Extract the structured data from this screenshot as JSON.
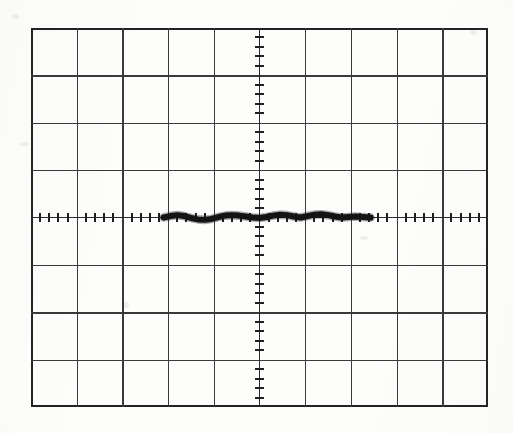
{
  "image": {
    "kind": "oscilloscope-screen-photograph",
    "background_color": "#fdfdfc",
    "width": 513,
    "height": 433
  },
  "graticule": {
    "name": "oscilloscope-graticule",
    "left": 31,
    "top": 28,
    "width": 457,
    "height": 379,
    "horizontal_divisions": 10,
    "vertical_divisions": 8,
    "division_width_px": 45.7,
    "division_height_px": 47.375,
    "border_color": "#232323",
    "border_width_px": 2.2,
    "grid_color": "#3a3a3a",
    "grid_line_width_px": 1.25,
    "center_x_px": 254,
    "center_y_px": 217,
    "subdivisions_per_division": 5,
    "tick_color": "#1f1f1f",
    "tick_length_px": 9
  },
  "chart_data": {
    "type": "line",
    "title": "",
    "subtitle": "",
    "xlabel": "",
    "ylabel": "",
    "legend": [],
    "grid": true,
    "legend_position": "none",
    "x_unit": "division",
    "y_unit": "division",
    "xlim": [
      -5,
      5
    ],
    "ylim": [
      -4,
      4
    ],
    "xticks": [
      -5,
      -4,
      -3,
      -2,
      -1,
      0,
      1,
      2,
      3,
      4,
      5
    ],
    "yticks": [
      -4,
      -3,
      -2,
      -1,
      0,
      1,
      2,
      3,
      4
    ],
    "xtick_labels": [
      "",
      "",
      "",
      "",
      "",
      "",
      "",
      "",
      "",
      "",
      ""
    ],
    "ytick_labels": [
      "",
      "",
      "",
      "",
      "",
      "",
      "",
      "",
      ""
    ],
    "series": [
      {
        "name": "trace",
        "color": "#141414",
        "stroke_width_px": 6,
        "x_start_div": -2.1,
        "x_end_div": 2.43,
        "x": [
          -2.1,
          -1.95,
          -1.8,
          -1.65,
          -1.5,
          -1.35,
          -1.2,
          -1.05,
          -0.9,
          -0.75,
          -0.6,
          -0.45,
          -0.3,
          -0.15,
          0.0,
          0.15,
          0.3,
          0.45,
          0.6,
          0.75,
          0.9,
          1.05,
          1.2,
          1.35,
          1.5,
          1.65,
          1.8,
          1.95,
          2.1,
          2.25,
          2.43
        ],
        "y": [
          0.0,
          0.03,
          0.05,
          0.03,
          -0.01,
          -0.04,
          -0.05,
          -0.03,
          0.01,
          0.04,
          0.05,
          0.04,
          0.02,
          0.0,
          -0.01,
          0.01,
          0.04,
          0.06,
          0.05,
          0.02,
          0.0,
          0.03,
          0.06,
          0.07,
          0.05,
          0.02,
          0.0,
          0.01,
          0.02,
          0.01,
          0.0
        ]
      }
    ],
    "annotations": []
  },
  "trace": {
    "name": "cathode-ray-trace",
    "description": "flat noisy baseline trace",
    "color": "#141414",
    "start_px": 158,
    "end_px": 365,
    "baseline_px": 217,
    "thickness_px": 6
  }
}
